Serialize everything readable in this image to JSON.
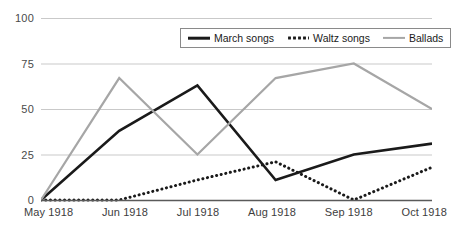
{
  "chart_data": {
    "type": "line",
    "title": "",
    "xlabel": "",
    "ylabel": "",
    "categories": [
      "May 1918",
      "Jun 1918",
      "Jul 1918",
      "Aug 1918",
      "Sep 1918",
      "Oct 1918"
    ],
    "ylim": [
      0,
      100
    ],
    "yticks": [
      0,
      25,
      50,
      75,
      100
    ],
    "ytick_labels": [
      "0",
      "25",
      "50",
      "75",
      "100"
    ],
    "grid": true,
    "grid_axis": "y",
    "legend_position": "top-center",
    "series": [
      {
        "name": "March songs",
        "style": "solid",
        "color": "#1a1a1a",
        "width": 2.6,
        "values": [
          0,
          38,
          63,
          11,
          25,
          31
        ]
      },
      {
        "name": "Waltz songs",
        "style": "dotted",
        "color": "#1a1a1a",
        "width": 3,
        "values": [
          0,
          0,
          11,
          21,
          0,
          18
        ]
      },
      {
        "name": "Ballads",
        "style": "solid",
        "color": "#a6a6a6",
        "width": 2.2,
        "values": [
          0,
          67,
          25,
          67,
          75,
          50
        ]
      }
    ],
    "colors": {
      "march": "#1a1a1a",
      "waltz": "#1a1a1a",
      "ballads": "#a6a6a6",
      "grid": "#c9c9c9",
      "axis": "#5a5a5a",
      "tick_text": "#3d3d3d",
      "background": "#ffffff"
    }
  }
}
